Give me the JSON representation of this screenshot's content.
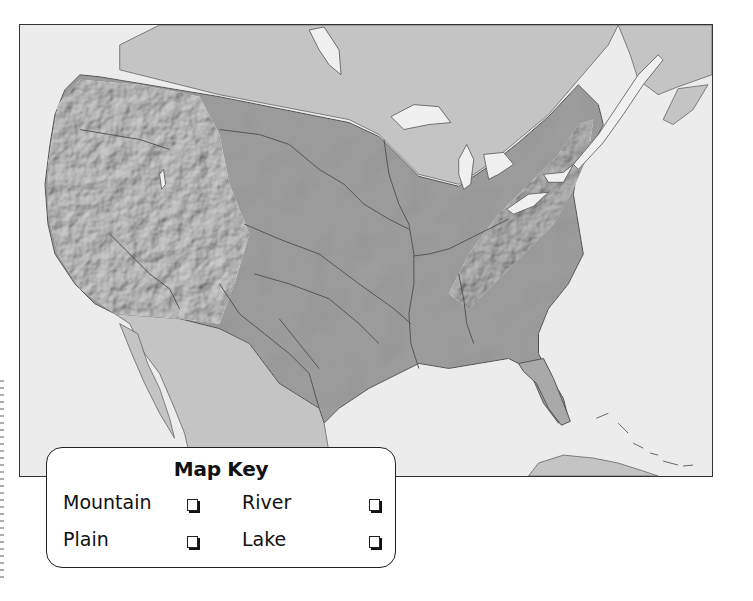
{
  "map": {
    "type": "physical relief map",
    "region": "United States (contiguous)",
    "colors": {
      "ocean": "#ececec",
      "foreign_land": "#c4c4c4",
      "us_land": "#a9a9a9",
      "mountains_highlight": "#d8d8d8",
      "lakes": "#f0f0f0",
      "rivers": "#555555",
      "frame": "#333333"
    }
  },
  "map_key": {
    "title": "Map Key",
    "items": [
      {
        "label": "Mountain",
        "checked": false
      },
      {
        "label": "River",
        "checked": false
      },
      {
        "label": "Plain",
        "checked": false
      },
      {
        "label": "Lake",
        "checked": false
      }
    ]
  }
}
